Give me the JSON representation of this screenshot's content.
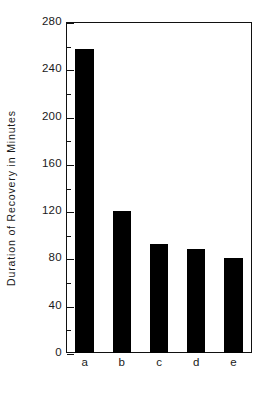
{
  "chart_data": {
    "type": "bar",
    "title": "",
    "subtitle": "",
    "xlabel": "",
    "ylabel": "Duration of  Recovery  in  Minutes",
    "categories": [
      "a",
      "b",
      "c",
      "d",
      "e"
    ],
    "values": [
      257,
      120,
      92,
      88,
      80
    ],
    "series": [
      {
        "name": "Duration of Recovery",
        "values": [
          257,
          120,
          92,
          88,
          80
        ]
      }
    ],
    "ylim": [
      0,
      280
    ],
    "xlim": [
      0,
      5
    ],
    "y_major_ticks": [
      0,
      40,
      80,
      120,
      160,
      200,
      240,
      280
    ],
    "y_major_tick_labels": [
      "0",
      "40",
      "80",
      "120",
      "160",
      "200",
      "240",
      "280"
    ],
    "y_minor_ticks": [
      20,
      60,
      100,
      140,
      180,
      220,
      260
    ],
    "grid": false,
    "legend": false,
    "legend_position": "none",
    "bar_color": "#000000",
    "axis_color": "#111111",
    "background_color": "#ffffff",
    "annotations": []
  },
  "figure": {
    "bar_color": "#000000",
    "axis_color": "#111111",
    "background_color": "#ffffff"
  }
}
